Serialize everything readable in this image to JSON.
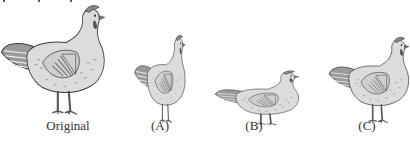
{
  "figure": {
    "panels": [
      {
        "id": "original",
        "label": "Original",
        "scale_x": 1.0,
        "scale_y": 1.0
      },
      {
        "id": "A",
        "label": "(A)",
        "scale_x": 0.55,
        "scale_y": 0.78
      },
      {
        "id": "B",
        "label": "(B)",
        "scale_x": 0.8,
        "scale_y": 0.45
      },
      {
        "id": "C",
        "label": "(C)",
        "scale_x": 0.75,
        "scale_y": 0.75
      }
    ]
  },
  "colors": {
    "body": "#dcdcdc",
    "outline": "#3a3a3a",
    "wing_stripes": "#777777",
    "legs": "#555555",
    "text": "#333333"
  }
}
